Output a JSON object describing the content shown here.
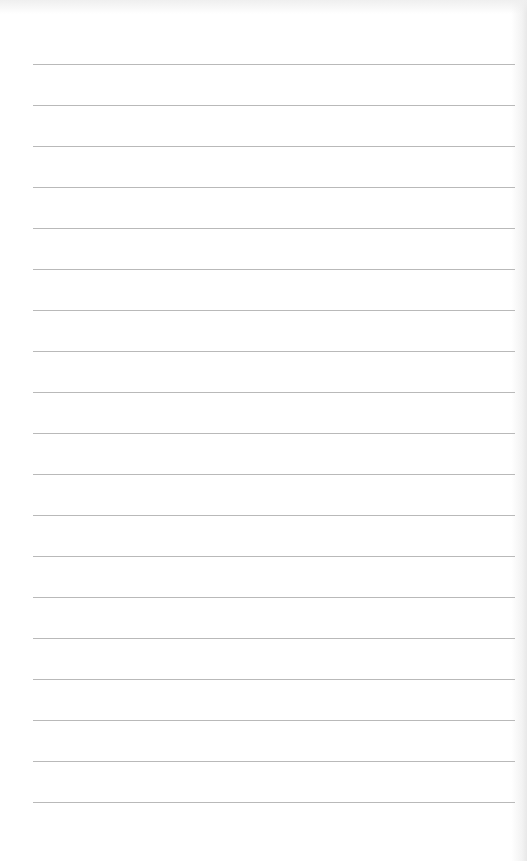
{
  "page": {
    "type": "lined-paper",
    "background_color": "#ffffff",
    "line_color": "#b9b9b9",
    "line_count": 19,
    "first_line_y": 64,
    "line_spacing": 41,
    "line_left": 33,
    "line_right": 515
  }
}
